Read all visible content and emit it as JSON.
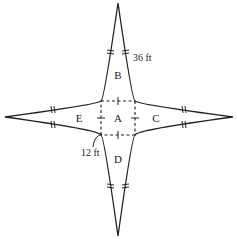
{
  "diagram": {
    "colors": {
      "stroke": "#222222",
      "background": "#ffffff"
    },
    "regions": {
      "center": "A",
      "top": "B",
      "right": "C",
      "bottom": "D",
      "left": "E"
    },
    "measurements": {
      "triangle_side": "36 ft",
      "square_side": "12 ft"
    },
    "tick_marks": {
      "triangle_sides": "double-hash (congruent)",
      "square_sides": "single-hash (congruent)"
    }
  }
}
